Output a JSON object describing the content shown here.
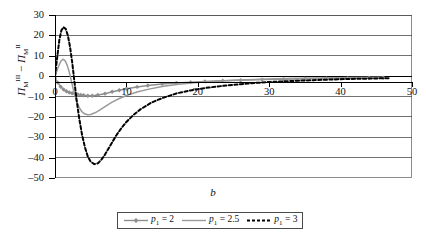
{
  "chart_data": {
    "type": "line",
    "title": "",
    "xlabel": "b",
    "ylabel": "Π_M^III − Π_M^II",
    "ylabel_parts": {
      "symbol": "Π",
      "sub": "M",
      "sup_left": "III",
      "sup_right": "II",
      "operator": "−"
    },
    "xlim": [
      0,
      50
    ],
    "ylim": [
      -50,
      30
    ],
    "xticks": [
      0,
      10,
      20,
      30,
      40,
      50
    ],
    "yticks": [
      30,
      20,
      10,
      0,
      -10,
      -20,
      -30,
      -40,
      -50
    ],
    "xtick_labels": [
      "0",
      "10",
      "20",
      "30",
      "40",
      "50"
    ],
    "ytick_labels": [
      "30",
      "20",
      "10",
      "0",
      "–10",
      "–20",
      "–30",
      "–40",
      "–50"
    ],
    "grid": true,
    "grid_axis": "y",
    "legend_position": "bottom-center",
    "series": [
      {
        "name": "p1 = 2",
        "color": "#8f8f8f",
        "style": "solid-markers",
        "marker": "diamond",
        "x": [
          0.0,
          0.4,
          0.8,
          1.2,
          1.6,
          2.0,
          2.4,
          2.8,
          3.2,
          3.6,
          4.0,
          4.6,
          5.2,
          6.0,
          7.0,
          8.0,
          9.0,
          10.0,
          11.5,
          13.0,
          15.0,
          17.0,
          19.0,
          21.0,
          23.5,
          26.0,
          29.0,
          32.0,
          35.0,
          38.0,
          41.0,
          44.0,
          46.0
        ],
        "y": [
          -1.0,
          -3.2,
          -5.2,
          -6.6,
          -7.4,
          -8.0,
          -8.4,
          -8.7,
          -9.0,
          -9.2,
          -9.4,
          -9.6,
          -9.6,
          -9.3,
          -8.6,
          -7.7,
          -6.9,
          -6.2,
          -5.3,
          -4.6,
          -3.9,
          -3.4,
          -3.0,
          -2.6,
          -2.3,
          -2.0,
          -1.7,
          -1.5,
          -1.3,
          -1.1,
          -1.0,
          -0.9,
          -0.8
        ]
      },
      {
        "name": "p1 = 2.5",
        "color": "#9a9a9a",
        "style": "solid",
        "marker": "none",
        "x": [
          0.0,
          0.4,
          0.8,
          1.1,
          1.4,
          1.7,
          2.0,
          2.3,
          2.6,
          3.0,
          3.4,
          3.8,
          4.2,
          4.6,
          5.0,
          5.6,
          6.2,
          7.0,
          8.0,
          9.0,
          10.0,
          11.5,
          13.0,
          15.0,
          17.0,
          19.5,
          22.0,
          25.0,
          28.0,
          31.0,
          34.0,
          38.0,
          42.0,
          46.0
        ],
        "y": [
          0.0,
          4.0,
          7.2,
          8.3,
          7.6,
          5.4,
          2.0,
          -2.5,
          -7.0,
          -12.0,
          -15.5,
          -17.6,
          -18.6,
          -19.0,
          -18.8,
          -18.0,
          -16.8,
          -15.0,
          -12.8,
          -11.0,
          -9.5,
          -7.8,
          -6.5,
          -5.1,
          -4.1,
          -3.2,
          -2.6,
          -2.0,
          -1.6,
          -1.3,
          -1.1,
          -0.9,
          -0.7,
          -0.6
        ]
      },
      {
        "name": "p1 = 3",
        "color": "#000000",
        "style": "dashed",
        "marker": "none",
        "x": [
          0.0,
          0.3,
          0.6,
          0.9,
          1.2,
          1.5,
          1.8,
          2.1,
          2.4,
          2.7,
          3.0,
          3.4,
          3.8,
          4.2,
          4.6,
          5.0,
          5.5,
          6.0,
          6.5,
          7.0,
          7.5,
          8.0,
          8.6,
          9.2,
          10.0,
          11.0,
          12.0,
          13.5,
          15.0,
          17.0,
          19.0,
          21.5,
          24.0,
          27.0,
          30.0,
          33.0,
          36.0,
          40.0,
          44.0,
          47.0
        ],
        "y": [
          0.0,
          9.0,
          17.5,
          22.5,
          24.0,
          23.2,
          20.0,
          14.5,
          7.0,
          -2.0,
          -11.0,
          -21.0,
          -29.0,
          -35.0,
          -39.5,
          -42.0,
          -43.2,
          -42.8,
          -41.0,
          -38.5,
          -35.5,
          -32.5,
          -29.0,
          -26.0,
          -22.5,
          -19.0,
          -16.2,
          -13.0,
          -10.8,
          -8.5,
          -7.0,
          -5.6,
          -4.6,
          -3.6,
          -2.9,
          -2.4,
          -2.0,
          -1.5,
          -1.2,
          -1.0
        ]
      }
    ]
  },
  "legend": {
    "items": [
      {
        "label_prefix": "p",
        "label_sub": "1",
        "label_rest": " = 2"
      },
      {
        "label_prefix": "p",
        "label_sub": "1",
        "label_rest": " = 2.5"
      },
      {
        "label_prefix": "p",
        "label_sub": "1",
        "label_rest": " = 3"
      }
    ]
  }
}
